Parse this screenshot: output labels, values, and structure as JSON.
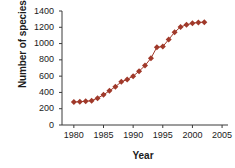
{
  "chart_data": {
    "type": "line",
    "title": "",
    "xlabel": "Year",
    "ylabel": "Number of species on list",
    "xlim": [
      1978,
      2006
    ],
    "ylim": [
      0,
      1400
    ],
    "xticks": [
      1980,
      1985,
      1990,
      1995,
      2000,
      2005
    ],
    "ytick_step": 200,
    "yticks": [
      0,
      200,
      400,
      600,
      800,
      1000,
      1200,
      1400
    ],
    "grid": false,
    "legend": null,
    "marker": "diamond",
    "marker_color": "#A0392A",
    "line_color": "#A0392A",
    "series": [
      {
        "name": "Species on list",
        "x": [
          1980,
          1981,
          1982,
          1983,
          1984,
          1985,
          1986,
          1987,
          1988,
          1989,
          1990,
          1991,
          1992,
          1993,
          1994,
          1995,
          1996,
          1997,
          1998,
          1999,
          2000,
          2001,
          2002
        ],
        "values": [
          281,
          287,
          291,
          299,
          330,
          370,
          420,
          470,
          530,
          560,
          600,
          660,
          730,
          820,
          955,
          963,
          1050,
          1140,
          1205,
          1230,
          1250,
          1260,
          1263
        ]
      }
    ]
  },
  "axis": {
    "x_tick_labels": [
      "1980",
      "1985",
      "1990",
      "1995",
      "2000",
      "2005"
    ],
    "y_tick_labels": [
      "1400",
      "1200",
      "1000",
      "800",
      "600",
      "400",
      "200",
      "0"
    ],
    "x_title": "Year",
    "y_title": "Number of species on list"
  },
  "style": {
    "axis_color": "#3a3a3a",
    "text_color": "#1b1b1b",
    "background": "#ffffff"
  }
}
